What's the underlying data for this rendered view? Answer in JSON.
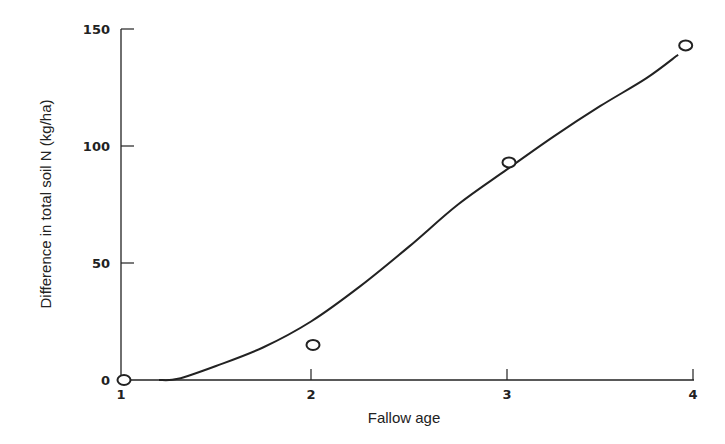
{
  "chart_data": {
    "type": "line",
    "title": "",
    "xlabel": "Fallow age",
    "ylabel": "Difference in total soil N (kg/ha)",
    "xlim": [
      1,
      4
    ],
    "ylim": [
      0,
      150
    ],
    "xticks": [
      1,
      2,
      3,
      4
    ],
    "yticks": [
      0,
      50,
      100,
      150
    ],
    "grid": false,
    "legend": null,
    "series": [
      {
        "name": "Observed",
        "kind": "scatter",
        "marker": "open-circle",
        "x": [
          1,
          2,
          3,
          3.95
        ],
        "y": [
          0,
          15,
          93,
          143
        ]
      },
      {
        "name": "Fitted curve",
        "kind": "line",
        "x": [
          1.2,
          1.3,
          1.5,
          1.75,
          2.0,
          2.25,
          2.5,
          2.75,
          3.0,
          3.25,
          3.5,
          3.75,
          3.92
        ],
        "y": [
          0,
          0.5,
          6,
          14,
          25,
          40,
          57,
          75,
          90,
          104,
          117,
          129,
          139
        ]
      }
    ]
  },
  "colors": {
    "ink": "#222222",
    "background": "#ffffff"
  }
}
